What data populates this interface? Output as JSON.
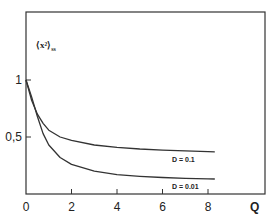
{
  "chart_data": {
    "type": "line",
    "title": "",
    "xlabel": "Q",
    "ylabel": "⟨x²⟩ss",
    "ylabel_main": "⟨x²⟩",
    "ylabel_sub": "ss",
    "xlim": [
      0,
      10.5
    ],
    "ylim": [
      0,
      1.0
    ],
    "x_ticks": [
      0,
      2,
      4,
      6,
      8
    ],
    "x_tick_labels": [
      "0",
      "2",
      "4",
      "6",
      "8"
    ],
    "y_ticks": [
      0.5,
      1
    ],
    "y_tick_labels": [
      "0,5",
      "1"
    ],
    "grid": false,
    "legend": "inline labels at curve ends",
    "series": [
      {
        "name": "D = 0.1",
        "label": "D = 0.1",
        "x": [
          0,
          0.25,
          0.5,
          0.75,
          1,
          1.5,
          2,
          3,
          4,
          5,
          6,
          7,
          8,
          8.3
        ],
        "y": [
          1.0,
          0.82,
          0.7,
          0.62,
          0.56,
          0.5,
          0.47,
          0.43,
          0.41,
          0.395,
          0.385,
          0.378,
          0.372,
          0.37
        ]
      },
      {
        "name": "D = 0.01",
        "label": "D = 0.01",
        "x": [
          0,
          0.25,
          0.5,
          0.75,
          1,
          1.5,
          2,
          3,
          4,
          5,
          6,
          7,
          8,
          8.3
        ],
        "y": [
          1.0,
          0.85,
          0.68,
          0.53,
          0.43,
          0.32,
          0.26,
          0.2,
          0.17,
          0.155,
          0.145,
          0.138,
          0.133,
          0.132
        ]
      }
    ]
  }
}
